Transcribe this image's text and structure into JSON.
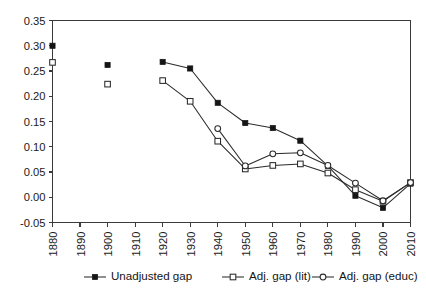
{
  "chart_data": {
    "type": "line",
    "title": "",
    "subtitle": "",
    "xlabel": "",
    "ylabel": "",
    "grid": false,
    "legend_position": "bottom",
    "x": [
      1880,
      1890,
      1900,
      1910,
      1920,
      1930,
      1940,
      1950,
      1960,
      1970,
      1980,
      1990,
      2000,
      2010
    ],
    "categories": [
      "1880",
      "1890",
      "1900",
      "1910",
      "1920",
      "1930",
      "1940",
      "1950",
      "1960",
      "1970",
      "1980",
      "1990",
      "2000",
      "2010"
    ],
    "xlim": [
      1880,
      2010
    ],
    "ylim": [
      -0.05,
      0.35
    ],
    "ytick_labels": [
      "0.35",
      "0.30",
      "0.25",
      "0.20",
      "0.15",
      "0.10",
      "0.05",
      "0.00",
      "-0.05"
    ],
    "ytick_values": [
      0.35,
      0.3,
      0.25,
      0.2,
      0.15,
      0.1,
      0.05,
      0.0,
      -0.05
    ],
    "series": [
      {
        "name": "Unadjusted gap",
        "marker": "filled-square",
        "connected_from": 1920,
        "values": [
          0.3,
          null,
          0.262,
          null,
          0.268,
          0.255,
          0.187,
          0.147,
          0.137,
          0.112,
          0.062,
          0.003,
          -0.021,
          0.027
        ]
      },
      {
        "name": "Adj. gap (lit)",
        "marker": "open-square",
        "connected_from": 1920,
        "values": [
          0.267,
          null,
          0.224,
          null,
          0.231,
          0.19,
          0.111,
          0.056,
          0.063,
          0.066,
          0.048,
          0.015,
          -0.008,
          0.029
        ]
      },
      {
        "name": "Adj. gap (educ)",
        "marker": "open-circle",
        "connected_from": 1940,
        "values": [
          null,
          null,
          null,
          null,
          null,
          null,
          0.136,
          0.062,
          0.086,
          0.088,
          0.063,
          0.028,
          -0.007,
          0.029
        ]
      }
    ]
  },
  "legend": {
    "items": [
      {
        "label": "Unadjusted gap",
        "marker": "filled-square"
      },
      {
        "label": "Adj. gap (lit)",
        "marker": "open-square"
      },
      {
        "label": "Adj. gap (educ)",
        "marker": "open-circle"
      }
    ]
  },
  "colors": {
    "line": "#2b2b2b",
    "marker_fill_dark": "#151515",
    "marker_fill_light": "#ffffff",
    "axis": "#3a3a3a",
    "text": "#141414",
    "background": "#ffffff"
  }
}
